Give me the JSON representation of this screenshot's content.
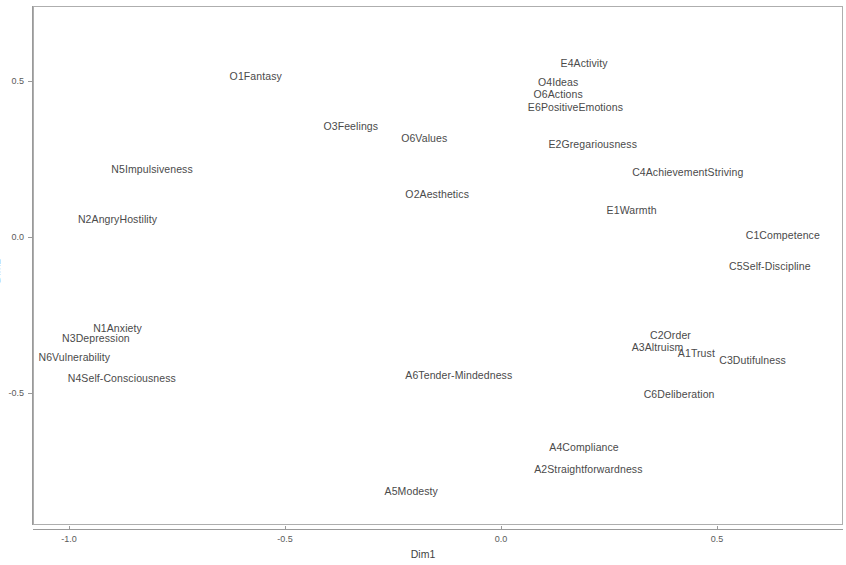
{
  "chart_data": {
    "type": "scatter",
    "title": "",
    "subtitle": "",
    "xlabel": "Dim1",
    "ylabel": "Dim2",
    "xlim": [
      -1.22,
      0.66
    ],
    "ylim": [
      -0.78,
      0.84
    ],
    "xticks": [
      -1.0,
      -0.5,
      0.0,
      0.5
    ],
    "xticklabels": [
      "-1.0",
      "-0.5",
      "0.0",
      "0.5"
    ],
    "yticks": [
      0.5,
      0.0,
      -0.5
    ],
    "yticklabels": [
      "0.5",
      "0.0",
      "-0.5"
    ],
    "grid": false,
    "legend": null,
    "marker": "text-label-only",
    "points": [
      {
        "label": "E5Excitement-Seeking",
        "x": -0.29,
        "y": 0.81
      },
      {
        "label": "E3Assertiveness",
        "x": 0.37,
        "y": 0.78
      },
      {
        "label": "O1Fantasy",
        "x": -0.57,
        "y": 0.52
      },
      {
        "label": "E4Activity",
        "x": 0.19,
        "y": 0.56
      },
      {
        "label": "O4Ideas",
        "x": 0.13,
        "y": 0.5
      },
      {
        "label": "O6Actions",
        "x": 0.13,
        "y": 0.46
      },
      {
        "label": "E6PositiveEmotions",
        "x": 0.17,
        "y": 0.42
      },
      {
        "label": "O3Feelings",
        "x": -0.35,
        "y": 0.36
      },
      {
        "label": "O6Values",
        "x": -0.18,
        "y": 0.32
      },
      {
        "label": "E2Gregariousness",
        "x": 0.21,
        "y": 0.3
      },
      {
        "label": "N5Impulsiveness",
        "x": -0.81,
        "y": 0.22
      },
      {
        "label": "C4AchievementStriving",
        "x": 0.43,
        "y": 0.21
      },
      {
        "label": "O2Aesthetics",
        "x": -0.15,
        "y": 0.14
      },
      {
        "label": "E1Warmth",
        "x": 0.3,
        "y": 0.09
      },
      {
        "label": "N2AngryHostility",
        "x": -0.89,
        "y": 0.06
      },
      {
        "label": "C1Competence",
        "x": 0.65,
        "y": 0.01
      },
      {
        "label": "C5Self-Discipline",
        "x": 0.62,
        "y": -0.09
      },
      {
        "label": "C2Order",
        "x": 0.39,
        "y": -0.31
      },
      {
        "label": "A3Altruism",
        "x": 0.36,
        "y": -0.35
      },
      {
        "label": "A1Trust",
        "x": 0.45,
        "y": -0.37
      },
      {
        "label": "N1Anxiety",
        "x": -0.89,
        "y": -0.29
      },
      {
        "label": "N3Depression",
        "x": -0.94,
        "y": -0.32
      },
      {
        "label": "C3Dutifulness",
        "x": 0.58,
        "y": -0.39
      },
      {
        "label": "N6Vulnerability",
        "x": -0.99,
        "y": -0.38
      },
      {
        "label": "A6Tender-Mindedness",
        "x": -0.1,
        "y": -0.44
      },
      {
        "label": "N4Self-Consciousness",
        "x": -0.88,
        "y": -0.45
      },
      {
        "label": "C6Deliberation",
        "x": 0.41,
        "y": -0.5
      },
      {
        "label": "A4Compliance",
        "x": 0.19,
        "y": -0.67
      },
      {
        "label": "A2Straightforwardness",
        "x": 0.2,
        "y": -0.74
      },
      {
        "label": "A5Modesty",
        "x": -0.21,
        "y": -0.81
      }
    ]
  },
  "axes": {
    "x_title": "Dim1",
    "y_title": "Dim2"
  }
}
